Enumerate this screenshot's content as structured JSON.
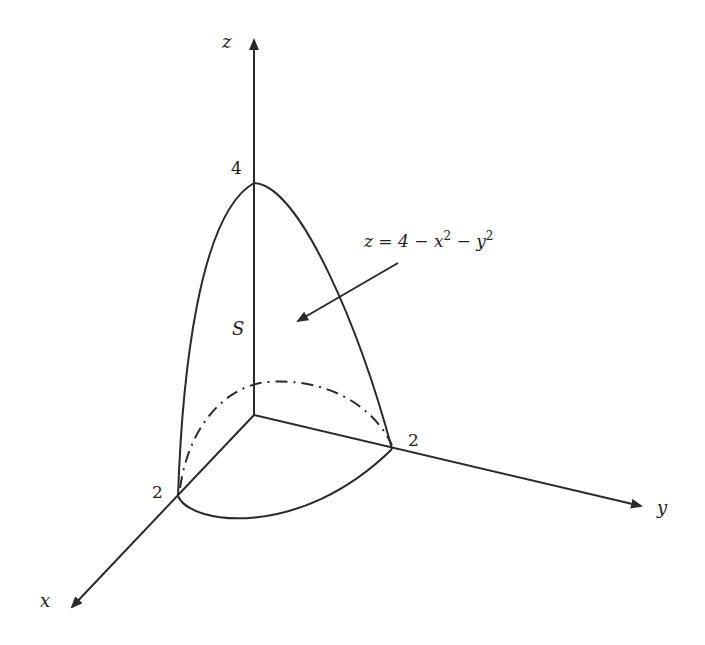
{
  "figure": {
    "axes": {
      "x_label": "x",
      "y_label": "y",
      "z_label": "z"
    },
    "ticks": {
      "z_intercept": "4",
      "x_intercept": "2",
      "y_intercept": "2"
    },
    "surface_label": "S",
    "equation": {
      "lhs": "z = 4 − x",
      "exp1": "2",
      "mid": " − y",
      "exp2": "2"
    },
    "colors": {
      "line": "#2a2a2a",
      "background": "#ffffff"
    }
  }
}
